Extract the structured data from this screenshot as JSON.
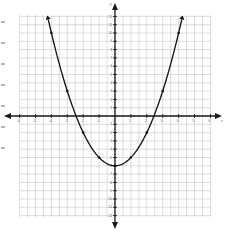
{
  "chart_data": {
    "type": "line",
    "title": "",
    "xlabel": "x",
    "ylabel": "y",
    "function": "y = x^2 - 6",
    "xlim": [
      -6,
      6
    ],
    "ylim": [
      -12,
      12
    ],
    "grid": true,
    "x_ticks": [
      -6,
      -5,
      -4,
      -3,
      -2,
      -1,
      0,
      1,
      2,
      3,
      4,
      5,
      6
    ],
    "y_ticks": [
      -12,
      -11,
      -10,
      -9,
      -8,
      -7,
      -6,
      -5,
      -4,
      -3,
      -2,
      -1,
      0,
      1,
      2,
      3,
      4,
      5,
      6,
      7,
      8,
      9,
      10,
      11,
      12
    ],
    "series": [
      {
        "name": "parabola",
        "x": [
          -4.2,
          -4,
          -3,
          -2,
          -1,
          0,
          1,
          2,
          3,
          4,
          4.2
        ],
        "y": [
          11.64,
          10,
          3,
          -2,
          -5,
          -6,
          -5,
          -2,
          3,
          10,
          11.64
        ]
      }
    ],
    "marked_points": [
      {
        "x": -4,
        "y": 10
      },
      {
        "x": -3,
        "y": 3
      },
      {
        "x": -2,
        "y": -2
      },
      {
        "x": -1,
        "y": -5
      },
      {
        "x": 0,
        "y": -6
      },
      {
        "x": 1,
        "y": -5
      },
      {
        "x": 2,
        "y": -2
      },
      {
        "x": 3,
        "y": 3
      },
      {
        "x": 4,
        "y": 10
      }
    ],
    "vertex": {
      "x": 0,
      "y": -6
    },
    "x_intercepts": [
      -2.45,
      2.45
    ],
    "y_intercept": -6
  },
  "style": {
    "grid_color": "#bdbdbd",
    "axis_color": "#1a1a1a",
    "curve_color": "#111111"
  },
  "margin_marks_y": [
    22,
    43,
    64,
    85,
    106,
    127,
    148
  ]
}
